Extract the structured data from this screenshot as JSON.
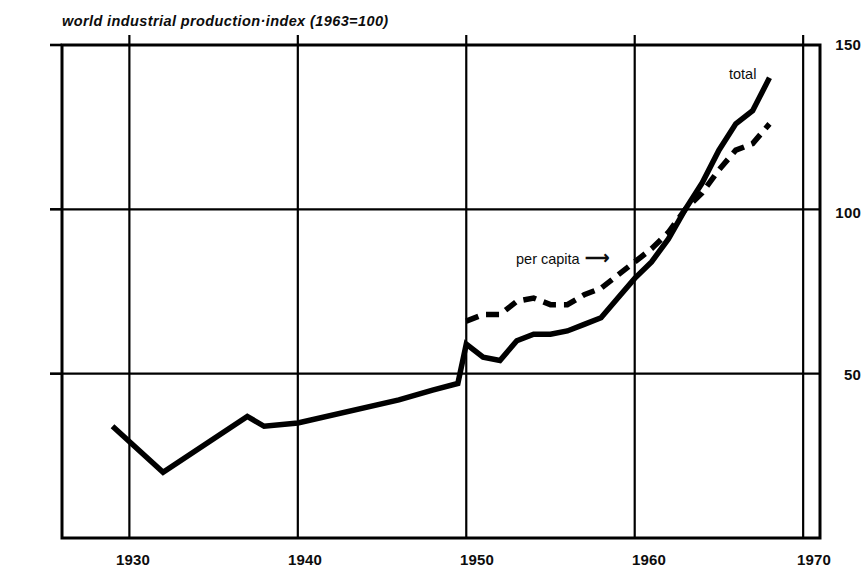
{
  "chart_data": {
    "type": "line",
    "title": "world industrial production·index (1963=100)",
    "xlabel": "",
    "ylabel": "",
    "xlim": [
      1926,
      1971
    ],
    "ylim": [
      0,
      150
    ],
    "y_ticks": [
      50,
      100,
      150
    ],
    "x_ticks": [
      1930,
      1940,
      1950,
      1960,
      1970
    ],
    "grid": true,
    "grid_style": "vertical lines at decades, horizontal lines at 50/100/150",
    "legend_position": "inline annotations on curves",
    "annotations": [
      {
        "text": "total",
        "target_series": "total",
        "x": 1967,
        "y": 142
      },
      {
        "text": "per capita →",
        "target_series": "per capita",
        "x": 1957,
        "y": 86
      }
    ],
    "series": [
      {
        "name": "total",
        "style": "solid",
        "color": "#000000",
        "points": [
          {
            "year": 1929,
            "value": 34
          },
          {
            "year": 1932,
            "value": 20
          },
          {
            "year": 1937,
            "value": 37
          },
          {
            "year": 1938,
            "value": 34
          },
          {
            "year": 1940,
            "value": 35
          },
          {
            "year": 1946,
            "value": 42
          },
          {
            "year": 1948,
            "value": 45
          },
          {
            "year": 1949.5,
            "value": 47
          },
          {
            "year": 1950,
            "value": 59
          },
          {
            "year": 1951,
            "value": 55
          },
          {
            "year": 1952,
            "value": 54
          },
          {
            "year": 1953,
            "value": 60
          },
          {
            "year": 1954,
            "value": 62
          },
          {
            "year": 1955,
            "value": 62
          },
          {
            "year": 1956,
            "value": 63
          },
          {
            "year": 1957,
            "value": 65
          },
          {
            "year": 1958,
            "value": 67
          },
          {
            "year": 1959,
            "value": 73
          },
          {
            "year": 1960,
            "value": 79
          },
          {
            "year": 1961,
            "value": 84
          },
          {
            "year": 1962,
            "value": 91
          },
          {
            "year": 1963,
            "value": 100
          },
          {
            "year": 1964,
            "value": 108
          },
          {
            "year": 1965,
            "value": 118
          },
          {
            "year": 1966,
            "value": 126
          },
          {
            "year": 1967,
            "value": 130
          },
          {
            "year": 1968,
            "value": 140
          }
        ]
      },
      {
        "name": "per capita",
        "style": "dashed",
        "color": "#000000",
        "points": [
          {
            "year": 1950,
            "value": 66
          },
          {
            "year": 1951,
            "value": 68
          },
          {
            "year": 1952,
            "value": 68
          },
          {
            "year": 1953,
            "value": 72
          },
          {
            "year": 1954,
            "value": 73
          },
          {
            "year": 1955,
            "value": 71
          },
          {
            "year": 1956,
            "value": 71
          },
          {
            "year": 1957,
            "value": 74
          },
          {
            "year": 1958,
            "value": 76
          },
          {
            "year": 1959,
            "value": 80
          },
          {
            "year": 1960,
            "value": 84
          },
          {
            "year": 1961,
            "value": 88
          },
          {
            "year": 1962,
            "value": 93
          },
          {
            "year": 1963,
            "value": 100
          },
          {
            "year": 1964,
            "value": 105
          },
          {
            "year": 1965,
            "value": 112
          },
          {
            "year": 1966,
            "value": 118
          },
          {
            "year": 1967,
            "value": 120
          },
          {
            "year": 1968,
            "value": 126
          }
        ]
      }
    ]
  },
  "axis": {
    "y_labels": [
      "150",
      "100",
      "50"
    ],
    "x_labels": [
      "1930",
      "1940",
      "1950",
      "1960",
      "1970"
    ]
  },
  "labels": {
    "total": "total",
    "per_capita": "per capita",
    "arrow": "→"
  },
  "colors": {
    "ink": "#0d0d0d",
    "line": "#000000",
    "frame": "#000000",
    "background": "#ffffff"
  }
}
